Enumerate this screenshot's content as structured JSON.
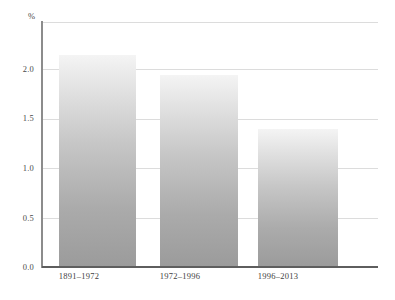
{
  "chart_data": {
    "type": "bar",
    "title": "",
    "subtitle": "",
    "xlabel": "",
    "ylabel": "%",
    "categories": [
      "1891–1972",
      "1972–1996",
      "1996–2013"
    ],
    "values": [
      2.15,
      1.94,
      1.4
    ],
    "series": [
      {
        "name": "",
        "values": [
          2.15,
          1.94,
          1.4
        ]
      }
    ],
    "ylim": [
      0.0,
      2.48
    ],
    "yticks": [
      "0.0",
      "0.5",
      "1.0",
      "1.5",
      "2.0"
    ],
    "ytick_values": [
      0.0,
      0.5,
      1.0,
      1.5,
      2.0
    ],
    "grid": true,
    "legend": "none",
    "annotations": [],
    "colors": {
      "bar_top": "#f4f4f4",
      "bar_bottom": "#9b9b9b",
      "gridline": "#dcdcdc",
      "axis": "#5e5e5e",
      "text": "#3f3f3f",
      "background": "#ffffff"
    }
  },
  "axes": {
    "unit_label": "%",
    "y_ticks": [
      {
        "label": "0.0",
        "value": 0.0
      },
      {
        "label": "0.5",
        "value": 0.5
      },
      {
        "label": "1.0",
        "value": 1.0
      },
      {
        "label": "1.5",
        "value": 1.5
      },
      {
        "label": "2.0",
        "value": 2.0
      }
    ],
    "x_ticks": [
      {
        "label": "1891–1972"
      },
      {
        "label": "1972–1996"
      },
      {
        "label": "1996–2013"
      }
    ]
  },
  "bars": [
    {
      "category": "1891–1972",
      "value": 2.15
    },
    {
      "category": "1972–1996",
      "value": 1.94
    },
    {
      "category": "1996–2013",
      "value": 1.4
    }
  ]
}
